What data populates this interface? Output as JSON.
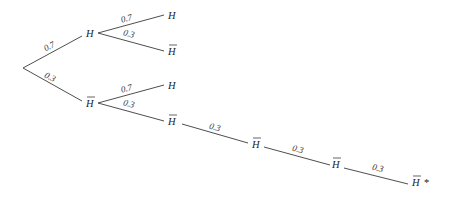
{
  "diagram": {
    "type": "probability-tree",
    "nodes": {
      "root": {
        "label": ""
      },
      "n1": {
        "label": "H",
        "bar": false
      },
      "n2": {
        "label": "H",
        "bar": true
      },
      "n1a": {
        "label": "H",
        "bar": false
      },
      "n1b": {
        "label": "H",
        "bar": true
      },
      "n2a": {
        "label": "H",
        "bar": false
      },
      "n2b": {
        "label": "H",
        "bar": true
      },
      "n3": {
        "label": "H",
        "bar": true
      },
      "n4": {
        "label": "H",
        "bar": true
      },
      "n5": {
        "label": "H",
        "bar": true,
        "suffix": "*"
      }
    },
    "edges": [
      {
        "from": "root",
        "to": "n1",
        "prob": "0.7"
      },
      {
        "from": "root",
        "to": "n2",
        "prob": "0.3"
      },
      {
        "from": "n1",
        "to": "n1a",
        "prob": "0.7"
      },
      {
        "from": "n1",
        "to": "n1b",
        "prob": "0.3"
      },
      {
        "from": "n2",
        "to": "n2a",
        "prob": "0.7"
      },
      {
        "from": "n2",
        "to": "n2b",
        "prob": "0.3"
      },
      {
        "from": "n2b",
        "to": "n3",
        "prob": "0.3"
      },
      {
        "from": "n3",
        "to": "n4",
        "prob": "0.3"
      },
      {
        "from": "n4",
        "to": "n5",
        "prob": "0.3"
      }
    ]
  }
}
